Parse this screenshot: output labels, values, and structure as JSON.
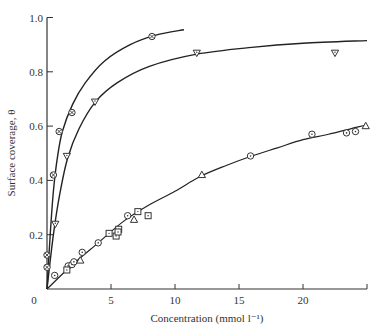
{
  "chart_data": {
    "type": "scatter",
    "title": "",
    "xlabel": "Concentration (mmol l⁻¹)",
    "ylabel": "Surface coverage, θ",
    "xlim": [
      0,
      25
    ],
    "ylim": [
      0,
      1.0
    ],
    "x_ticks": [
      0,
      5,
      10,
      15,
      20
    ],
    "x_tick_labels": [
      "0",
      "5",
      "10",
      "15",
      "20"
    ],
    "y_ticks": [
      0.2,
      0.4,
      0.6,
      0.8,
      1.0
    ],
    "y_tick_labels": [
      "0.2",
      "0.4",
      "0.6",
      "0.8",
      "1.0"
    ],
    "grid": false,
    "legend": null,
    "series": [
      {
        "name": "circle-cross (steepest curve)",
        "marker": "circle-cross",
        "points": [
          [
            0.0,
            0.08
          ],
          [
            0.0,
            0.125
          ],
          [
            0.5,
            0.42
          ],
          [
            0.95,
            0.58
          ],
          [
            1.95,
            0.65
          ],
          [
            8.2,
            0.93
          ]
        ],
        "fit_curve": [
          [
            0,
            0
          ],
          [
            0.25,
            0.2
          ],
          [
            0.5,
            0.36
          ],
          [
            0.8,
            0.48
          ],
          [
            1.2,
            0.58
          ],
          [
            2,
            0.68
          ],
          [
            3,
            0.76
          ],
          [
            4.5,
            0.84
          ],
          [
            6.5,
            0.9
          ],
          [
            8.5,
            0.935
          ],
          [
            10.7,
            0.955
          ]
        ]
      },
      {
        "name": "inverted-triangle (second curve)",
        "marker": "triangle-down",
        "points": [
          [
            0.65,
            0.24
          ],
          [
            1.55,
            0.49
          ],
          [
            3.75,
            0.69
          ],
          [
            11.7,
            0.87
          ],
          [
            22.5,
            0.87
          ]
        ],
        "fit_curve": [
          [
            0,
            0
          ],
          [
            0.5,
            0.2
          ],
          [
            1,
            0.35
          ],
          [
            1.6,
            0.48
          ],
          [
            2.5,
            0.59
          ],
          [
            3.8,
            0.69
          ],
          [
            5.5,
            0.76
          ],
          [
            8,
            0.82
          ],
          [
            11.7,
            0.865
          ],
          [
            16,
            0.89
          ],
          [
            20,
            0.905
          ],
          [
            25,
            0.915
          ]
        ]
      },
      {
        "name": "circle-dot (linear series)",
        "marker": "circle-dot",
        "points": [
          [
            0.6,
            0.05
          ],
          [
            1.65,
            0.085
          ],
          [
            1.95,
            0.09
          ],
          [
            2.1,
            0.1
          ],
          [
            2.75,
            0.135
          ],
          [
            4.0,
            0.17
          ],
          [
            6.3,
            0.27
          ],
          [
            15.9,
            0.49
          ],
          [
            20.7,
            0.57
          ],
          [
            23.4,
            0.575
          ],
          [
            24.1,
            0.58
          ]
        ]
      },
      {
        "name": "square-dot (linear series)",
        "marker": "square-dot",
        "points": [
          [
            1.55,
            0.07
          ],
          [
            4.85,
            0.205
          ],
          [
            5.4,
            0.195
          ],
          [
            5.6,
            0.22
          ],
          [
            5.55,
            0.21
          ],
          [
            7.1,
            0.285
          ],
          [
            7.9,
            0.27
          ]
        ]
      },
      {
        "name": "triangle-up (linear series)",
        "marker": "triangle-up",
        "points": [
          [
            2.6,
            0.105
          ],
          [
            6.8,
            0.255
          ],
          [
            12.1,
            0.42
          ],
          [
            24.9,
            0.6
          ]
        ]
      }
    ],
    "lower_fit_curve": [
      [
        0,
        0
      ],
      [
        2,
        0.09
      ],
      [
        4,
        0.17
      ],
      [
        6,
        0.25
      ],
      [
        8,
        0.31
      ],
      [
        10,
        0.36
      ],
      [
        12,
        0.415
      ],
      [
        14,
        0.455
      ],
      [
        16,
        0.49
      ],
      [
        18,
        0.52
      ],
      [
        20,
        0.55
      ],
      [
        22,
        0.57
      ],
      [
        25,
        0.605
      ]
    ]
  }
}
